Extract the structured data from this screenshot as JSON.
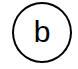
{
  "diagram": {
    "nodes": [
      {
        "id": "b",
        "label": "b",
        "shape": "circle",
        "stroke_color": "#000000",
        "fill_color": "#ffffff",
        "text_color": "#000000"
      }
    ]
  }
}
